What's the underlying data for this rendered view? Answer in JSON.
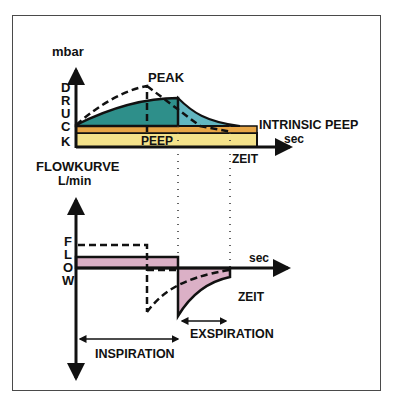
{
  "pressure_chart": {
    "y_unit": "mbar",
    "y_label_letters": [
      "D",
      "R",
      "U",
      "C",
      "K"
    ],
    "peak_label": "PEAK",
    "peep_label": "PEEP",
    "intrinsic_peep_label": "INTRINSIC PEEP",
    "x_unit": "sec",
    "x_label": "ZEIT"
  },
  "flow_chart": {
    "title": "FLOWKURVE",
    "y_unit": "L/min",
    "y_label_letters": [
      "F",
      "L",
      "O",
      "W"
    ],
    "x_unit": "sec",
    "x_label": "ZEIT",
    "exspiration_label": "EXSPIRATION",
    "inspiration_label": "INSPIRATION"
  },
  "colors": {
    "inspiration_pressure": "#2e8f8a",
    "exspiration_pressure": "#62b6c0",
    "intrinsic_peep_band": "#e8a646",
    "peep_band": "#f4e28a",
    "flow_fill": "#dbb0c6",
    "line": "#111111"
  }
}
